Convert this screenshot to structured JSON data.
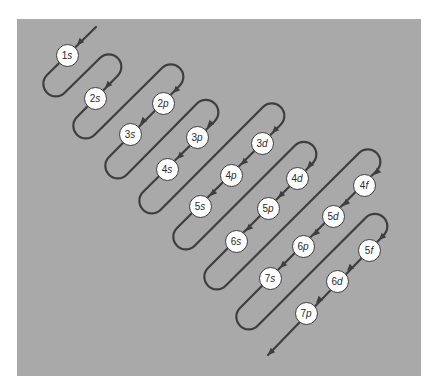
{
  "diagram": {
    "colors": {
      "panel": "#a9a9a9",
      "line": "#3e3e3e",
      "node_fill": "#ffffff",
      "node_text": "#2a2a2a"
    },
    "start": {
      "x": 96,
      "y": 27
    },
    "end": {
      "x": 268,
      "y": 355
    },
    "diagonals": [
      {
        "c": 122,
        "nodes": [
          {
            "label": "1s",
            "n": "1",
            "l": "s",
            "x": 67,
            "y": 55
          }
        ],
        "bottom_x": 47,
        "top_x": 100
      },
      {
        "c": 194,
        "nodes": [
          {
            "label": "2s",
            "n": "2",
            "l": "s",
            "x": 95,
            "y": 98
          }
        ],
        "bottom_x": 77,
        "top_x": 162
      },
      {
        "c": 266,
        "nodes": [
          {
            "label": "2p",
            "n": "2",
            "l": "p",
            "x": 163,
            "y": 103
          },
          {
            "label": "3s",
            "n": "3",
            "l": "s",
            "x": 130,
            "y": 134
          }
        ],
        "bottom_x": 109,
        "top_x": 197
      },
      {
        "c": 335,
        "nodes": [
          {
            "label": "3p",
            "n": "3",
            "l": "p",
            "x": 197,
            "y": 137
          },
          {
            "label": "4s",
            "n": "4",
            "l": "s",
            "x": 167,
            "y": 169
          }
        ],
        "bottom_x": 143,
        "top_x": 263
      },
      {
        "c": 405,
        "nodes": [
          {
            "label": "3d",
            "n": "3",
            "l": "d",
            "x": 262,
            "y": 143
          },
          {
            "label": "4p",
            "n": "4",
            "l": "p",
            "x": 231,
            "y": 175
          },
          {
            "label": "5s",
            "n": "5",
            "l": "s",
            "x": 200,
            "y": 206
          }
        ],
        "bottom_x": 177,
        "top_x": 295
      },
      {
        "c": 476,
        "nodes": [
          {
            "label": "4d",
            "n": "4",
            "l": "d",
            "x": 297,
            "y": 178
          },
          {
            "label": "5p",
            "n": "5",
            "l": "p",
            "x": 268,
            "y": 208
          },
          {
            "label": "6s",
            "n": "6",
            "l": "s",
            "x": 236,
            "y": 241
          }
        ],
        "bottom_x": 208,
        "top_x": 359
      },
      {
        "c": 548,
        "nodes": [
          {
            "label": "4f",
            "n": "4",
            "l": "f",
            "x": 364,
            "y": 185
          },
          {
            "label": "5d",
            "n": "5",
            "l": "d",
            "x": 333,
            "y": 216
          },
          {
            "label": "6p",
            "n": "6",
            "l": "p",
            "x": 303,
            "y": 246
          },
          {
            "label": "7s",
            "n": "7",
            "l": "s",
            "x": 270,
            "y": 278
          }
        ],
        "bottom_x": 240,
        "top_x": 366
      },
      {
        "c": 619,
        "nodes": [
          {
            "label": "5f",
            "n": "5",
            "l": "f",
            "x": 369,
            "y": 250
          },
          {
            "label": "6d",
            "n": "6",
            "l": "d",
            "x": 337,
            "y": 281
          },
          {
            "label": "7p",
            "n": "7",
            "l": "p",
            "x": 306,
            "y": 313
          }
        ],
        "bottom_x": null,
        "top_x": null
      }
    ]
  }
}
